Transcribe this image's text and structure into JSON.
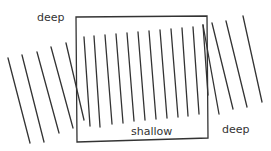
{
  "labels": {
    "deep_left": "deep",
    "shallow": "shallow",
    "deep_right": "deep"
  },
  "colors": {
    "line": "#333333",
    "box": "#333333",
    "background": "#ffffff"
  },
  "diagram": {
    "type": "wave-refraction",
    "box": {
      "tl": [
        76,
        17
      ],
      "tr": [
        207,
        16
      ],
      "br": [
        208,
        138
      ],
      "bl": [
        77,
        142
      ]
    },
    "left_deep_lines": [
      [
        [
          8,
          58
        ],
        [
          30,
          143
        ]
      ],
      [
        [
          22,
          55
        ],
        [
          44,
          142
        ]
      ],
      [
        [
          37,
          52
        ],
        [
          59,
          133
        ]
      ],
      [
        [
          51,
          47
        ],
        [
          73,
          128
        ]
      ],
      [
        [
          66,
          43
        ],
        [
          84,
          120
        ]
      ]
    ],
    "shallow_lines": [
      [
        [
          84,
          37
        ],
        [
          90,
          126
        ]
      ],
      [
        [
          94,
          36
        ],
        [
          100,
          127
        ]
      ],
      [
        [
          105,
          35
        ],
        [
          112,
          124
        ]
      ],
      [
        [
          116,
          34
        ],
        [
          123,
          123
        ]
      ],
      [
        [
          127,
          33
        ],
        [
          134,
          121
        ]
      ],
      [
        [
          138,
          32
        ],
        [
          145,
          120
        ]
      ],
      [
        [
          149,
          31
        ],
        [
          156,
          119
        ]
      ],
      [
        [
          160,
          30
        ],
        [
          167,
          118
        ]
      ],
      [
        [
          171,
          29
        ],
        [
          178,
          117
        ]
      ],
      [
        [
          182,
          28
        ],
        [
          188,
          116
        ]
      ],
      [
        [
          193,
          27
        ],
        [
          199,
          114
        ]
      ],
      [
        [
          203,
          25
        ],
        [
          208,
          95
        ]
      ]
    ],
    "right_deep_lines": [
      [
        [
          203,
          25
        ],
        [
          219,
          114
        ]
      ],
      [
        [
          212,
          23
        ],
        [
          233,
          109
        ]
      ],
      [
        [
          226,
          21
        ],
        [
          247,
          107
        ]
      ],
      [
        [
          243,
          16
        ],
        [
          262,
          102
        ]
      ]
    ]
  }
}
